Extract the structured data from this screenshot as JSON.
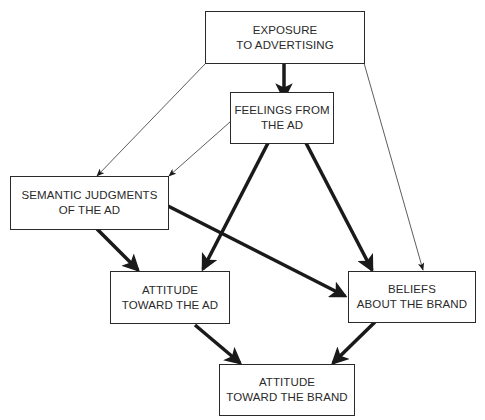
{
  "diagram": {
    "nodes": {
      "exposure": {
        "line1": "EXPOSURE",
        "line2": "TO ADVERTISING"
      },
      "feelings": {
        "line1": "FEELINGS FROM",
        "line2": "THE AD"
      },
      "semantic": {
        "line1": "SEMANTIC JUDGMENTS",
        "line2": "OF THE AD"
      },
      "attitude_ad": {
        "line1": "ATTITUDE",
        "line2": "TOWARD THE AD"
      },
      "beliefs": {
        "line1": "BELIEFS",
        "line2": "ABOUT THE BRAND"
      },
      "attitude_brand": {
        "line1": "ATTITUDE",
        "line2": "TOWARD THE BRAND"
      }
    },
    "edges": [
      {
        "from": "EXPOSURE TO ADVERTISING",
        "to": "FEELINGS FROM THE AD",
        "weight": "thick"
      },
      {
        "from": "EXPOSURE TO ADVERTISING",
        "to": "SEMANTIC JUDGMENTS OF THE AD",
        "weight": "thin"
      },
      {
        "from": "EXPOSURE TO ADVERTISING",
        "to": "BELIEFS ABOUT THE BRAND",
        "weight": "thin"
      },
      {
        "from": "FEELINGS FROM THE AD",
        "to": "SEMANTIC JUDGMENTS OF THE AD",
        "weight": "thin"
      },
      {
        "from": "FEELINGS FROM THE AD",
        "to": "ATTITUDE TOWARD THE AD",
        "weight": "thick"
      },
      {
        "from": "FEELINGS FROM THE AD",
        "to": "BELIEFS ABOUT THE BRAND",
        "weight": "thick"
      },
      {
        "from": "SEMANTIC JUDGMENTS OF THE AD",
        "to": "ATTITUDE TOWARD THE AD",
        "weight": "thick"
      },
      {
        "from": "SEMANTIC JUDGMENTS OF THE AD",
        "to": "BELIEFS ABOUT THE BRAND",
        "weight": "thick"
      },
      {
        "from": "ATTITUDE TOWARD THE AD",
        "to": "ATTITUDE TOWARD THE BRAND",
        "weight": "thick"
      },
      {
        "from": "BELIEFS ABOUT THE BRAND",
        "to": "ATTITUDE TOWARD THE BRAND",
        "weight": "thick"
      }
    ],
    "colors": {
      "line": "#1a1a1a",
      "box_border": "#2a2a2a",
      "text": "#2a2a2a",
      "background": "#ffffff"
    }
  }
}
